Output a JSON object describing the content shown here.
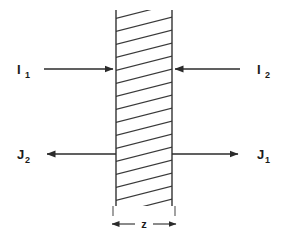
{
  "figure": {
    "type": "physics-slab-flux-diagram",
    "background_color": "#ffffff",
    "line_color": "#333333",
    "hatch_color": "#3a3a3a",
    "text_color": "#1a1a1a"
  },
  "slab": {
    "name": "hatched-slab",
    "left_edge_x": 116,
    "right_edge_x": 172,
    "top_y": 10,
    "bottom_y": 206,
    "thickness_label": "z",
    "hatch_direction": "up-right",
    "hatch_count": 15
  },
  "labels": {
    "incident_left": {
      "base": "I",
      "sub": "1"
    },
    "incident_right": {
      "base": "I",
      "sub": "2"
    },
    "emergent_left": {
      "base": "J",
      "sub": "2"
    },
    "emergent_right": {
      "base": "J",
      "sub": "1"
    },
    "thickness": "z"
  },
  "arrows": [
    {
      "name": "arrow-I1",
      "label_base": "I",
      "label_sub": "1",
      "direction": "right",
      "row": "upper",
      "side": "left",
      "y": 69,
      "from_x": 44,
      "to_x": 115
    },
    {
      "name": "arrow-I2",
      "label_base": "I",
      "label_sub": "2",
      "direction": "left",
      "row": "upper",
      "side": "right",
      "y": 69,
      "from_x": 240,
      "to_x": 173
    },
    {
      "name": "arrow-J2",
      "label_base": "J",
      "label_sub": "2",
      "direction": "left",
      "row": "lower",
      "side": "left",
      "y": 154,
      "from_x": 116,
      "to_x": 45
    },
    {
      "name": "arrow-J1",
      "label_base": "J",
      "label_sub": "1",
      "direction": "right",
      "row": "lower",
      "side": "right",
      "y": 154,
      "from_x": 172,
      "to_x": 240
    }
  ],
  "dimension": {
    "name": "thickness-dimension",
    "label": "z",
    "y": 224,
    "left_x": 112,
    "right_x": 176,
    "style": "double-headed-arrow"
  }
}
